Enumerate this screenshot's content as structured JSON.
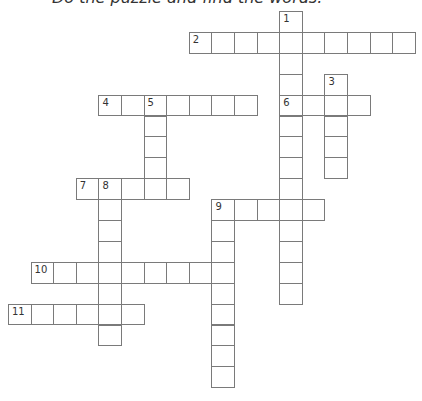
{
  "instruction": "Do the puzzle and find the words.",
  "grid": {
    "cell_width": 22.6,
    "cell_height": 20.9,
    "origin_x": 8,
    "origin_y": 11,
    "line_color": "#7a7a7a"
  },
  "words": [
    {
      "number": "1",
      "direction": "down",
      "row": 0,
      "col": 12,
      "length": 14
    },
    {
      "number": "2",
      "direction": "across",
      "row": 1,
      "col": 8,
      "length": 10
    },
    {
      "number": "3",
      "direction": "down",
      "row": 3,
      "col": 14,
      "length": 5
    },
    {
      "number": "4",
      "direction": "across",
      "row": 4,
      "col": 4,
      "length": 7
    },
    {
      "number": "5",
      "direction": "down",
      "row": 4,
      "col": 6,
      "length": 5
    },
    {
      "number": "6",
      "direction": "across",
      "row": 4,
      "col": 12,
      "length": 4
    },
    {
      "number": "7",
      "direction": "across",
      "row": 8,
      "col": 3,
      "length": 5
    },
    {
      "number": "8",
      "direction": "down",
      "row": 8,
      "col": 4,
      "length": 8
    },
    {
      "number": "9",
      "direction": "across",
      "row": 9,
      "col": 9,
      "length": 5
    },
    {
      "number": "9",
      "direction": "down",
      "row": 9,
      "col": 9,
      "length": 9
    },
    {
      "number": "10",
      "direction": "across",
      "row": 12,
      "col": 1,
      "length": 9
    },
    {
      "number": "11",
      "direction": "across",
      "row": 14,
      "col": 0,
      "length": 6
    }
  ]
}
